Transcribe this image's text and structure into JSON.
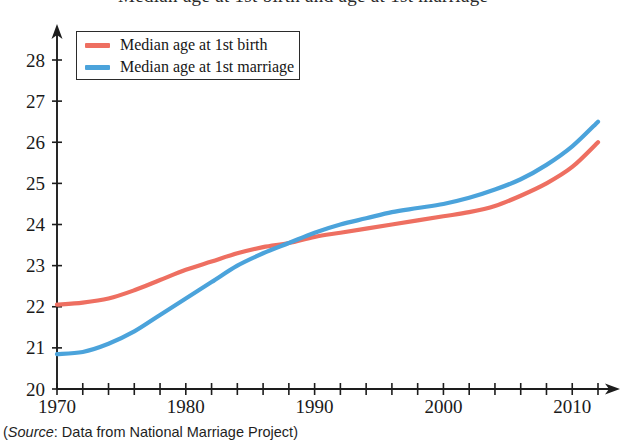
{
  "figure": {
    "title_partial": "Median age at 1st birth and age at 1st marriage",
    "source_open_paren": "(",
    "source_word": "Source",
    "source_rest": ": Data from National Marriage Project)"
  },
  "legend": {
    "entries": [
      {
        "label": "Median age at 1st birth",
        "color": "#EE6F61",
        "swatch_name": "legend-swatch-birth"
      },
      {
        "label": "Median age at 1st marriage",
        "color": "#4BA3DB",
        "swatch_name": "legend-swatch-marriage"
      }
    ]
  },
  "axes": {
    "y_ticks": [
      "20",
      "21",
      "22",
      "23",
      "24",
      "25",
      "26",
      "27",
      "28"
    ],
    "x_ticks": [
      "1970",
      "1980",
      "1990",
      "2000",
      "2010"
    ]
  },
  "chart_data": {
    "type": "line",
    "title": "Median age at 1st birth and age at 1st marriage",
    "xlabel": "",
    "ylabel": "",
    "xlim": [
      1970,
      2012
    ],
    "ylim": [
      20,
      28
    ],
    "ytick_step": 1,
    "xtick_labeled_step": 10,
    "xtick_minor_step": 2,
    "grid": false,
    "legend_position": "upper-left",
    "annotation": "(Source: Data from National Marriage Project)",
    "x": [
      1970,
      1972,
      1974,
      1976,
      1978,
      1980,
      1982,
      1984,
      1986,
      1988,
      1990,
      1992,
      1994,
      1996,
      1998,
      2000,
      2002,
      2004,
      2006,
      2008,
      2010,
      2012
    ],
    "series": [
      {
        "name": "Median age at 1st birth",
        "color": "#EE6F61",
        "values": [
          22.05,
          22.1,
          22.2,
          22.4,
          22.65,
          22.9,
          23.1,
          23.3,
          23.45,
          23.55,
          23.7,
          23.8,
          23.9,
          24.0,
          24.1,
          24.2,
          24.3,
          24.45,
          24.7,
          25.0,
          25.4,
          26.0
        ]
      },
      {
        "name": "Median age at 1st marriage",
        "color": "#4BA3DB",
        "values": [
          20.85,
          20.9,
          21.1,
          21.4,
          21.8,
          22.2,
          22.6,
          23.0,
          23.3,
          23.55,
          23.8,
          24.0,
          24.15,
          24.3,
          24.4,
          24.5,
          24.65,
          24.85,
          25.1,
          25.45,
          25.9,
          26.5
        ]
      }
    ],
    "crossing_point": {
      "x": 1989,
      "y": 23.6
    }
  }
}
